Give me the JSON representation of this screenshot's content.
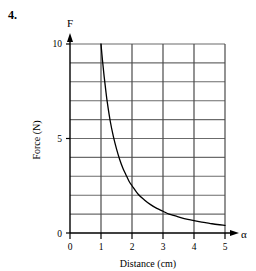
{
  "question": {
    "number": "4."
  },
  "chart_data": {
    "type": "line",
    "title": "",
    "xlabel": "Distance (cm)",
    "ylabel": "Force (N)",
    "x_axis_symbol": "α",
    "y_axis_symbol": "F",
    "xlim": [
      0,
      5
    ],
    "ylim": [
      0,
      10
    ],
    "xticks": [
      0,
      1,
      2,
      3,
      4,
      5
    ],
    "xtick_labels": [
      "0",
      "1",
      "2",
      "3",
      "4",
      "5"
    ],
    "yticks": [
      0,
      5,
      10
    ],
    "ytick_labels": [
      "0",
      "5",
      "10"
    ],
    "grid": true,
    "grid_x_step": 1,
    "grid_y_step": 1,
    "legend": "none",
    "series": [
      {
        "name": "Force vs Distance",
        "relation": "inverse-square decay",
        "x": [
          1.0,
          1.05,
          1.1,
          1.15,
          1.2,
          1.3,
          1.4,
          1.5,
          1.6,
          1.7,
          1.8,
          1.9,
          2.0,
          2.2,
          2.4,
          2.6,
          2.8,
          3.0,
          3.2,
          3.4,
          3.6,
          3.8,
          4.0,
          4.25,
          4.5,
          4.75,
          5.0
        ],
        "y": [
          10.0,
          9.1,
          8.3,
          7.6,
          6.95,
          5.9,
          5.1,
          4.45,
          3.9,
          3.45,
          3.1,
          2.75,
          2.5,
          2.05,
          1.75,
          1.5,
          1.3,
          1.15,
          1.0,
          0.9,
          0.8,
          0.72,
          0.65,
          0.57,
          0.51,
          0.45,
          0.4
        ]
      }
    ],
    "colors": {
      "curve": "#000000",
      "axis": "#000000",
      "grid": "#6b6b6b",
      "background": "#ffffff"
    }
  }
}
